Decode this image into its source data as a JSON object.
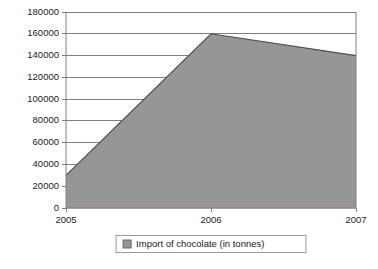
{
  "chart_data": {
    "type": "area",
    "title": "",
    "xlabel": "",
    "ylabel": "",
    "categories": [
      "2005",
      "2006",
      "2007"
    ],
    "x": [
      2005,
      2006,
      2007
    ],
    "series": [
      {
        "name": "Import of chocolate (in tonnes)",
        "values": [
          30000,
          160000,
          140000
        ],
        "color": "#969696",
        "line_color": "#4d4d4d"
      },
      {
        "name": "baseline-series",
        "values": [
          0,
          0,
          0
        ],
        "color": "#c47d7d",
        "line_color": "#c47d7d"
      }
    ],
    "ylim": [
      0,
      180000
    ],
    "ytick_values": [
      0,
      20000,
      40000,
      60000,
      80000,
      100000,
      120000,
      140000,
      160000,
      180000
    ],
    "ytick_labels": [
      "0",
      "20000",
      "40000",
      "60000",
      "80000",
      "100000",
      "120000",
      "140000",
      "160000",
      "180000"
    ],
    "xtick_labels": [
      "2005",
      "2006",
      "2007"
    ],
    "grid": true,
    "grid_axis": "y",
    "grid_color": "#808080",
    "axis_color": "#808080",
    "plot_background": "#ffffff",
    "legend_position": "bottom"
  },
  "legend": {
    "entries": [
      {
        "label": "Import of chocolate (in tonnes)",
        "swatch_color": "#969696"
      }
    ]
  }
}
